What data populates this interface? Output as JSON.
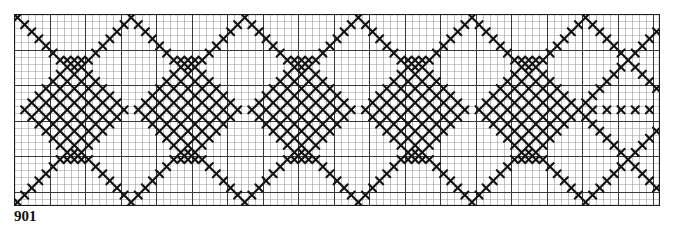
{
  "document": {
    "kind": "cross-stitch-pattern-chart",
    "label": "901",
    "background_color": "#ffffff"
  },
  "grid": {
    "origin_x": 14,
    "origin_y": 14,
    "cell_size": 7.1,
    "columns": 91,
    "rows": 27,
    "minor_line_color": "#9a9a9a",
    "minor_line_width": 0.6,
    "major_line_color": "#3a3a3a",
    "major_line_width": 1.0,
    "major_every": 5,
    "border_color": "#1a1a1a",
    "border_width": 1.2
  },
  "stitch": {
    "symbol": "x",
    "symbol_name": "cross-stitch-x",
    "color": "#111111",
    "stroke_width": 2.1
  },
  "chart_data": {
    "type": "heatmap",
    "title": "901",
    "xlabel": "",
    "ylabel": "",
    "grid": true,
    "legend": "none",
    "columns": 91,
    "rows": 27,
    "repeat_period_columns": 16,
    "symmetry": "mirror-horizontal-axis",
    "filled_cells_by_row": {
      "0": [
        0,
        16,
        32,
        48,
        64,
        80
      ],
      "1": [
        1,
        15,
        17,
        31,
        33,
        47,
        49,
        63,
        65,
        79,
        81
      ],
      "2": [
        2,
        14,
        18,
        30,
        34,
        46,
        50,
        62,
        66,
        78,
        82,
        90
      ],
      "3": [
        3,
        13,
        19,
        29,
        35,
        45,
        51,
        61,
        67,
        77,
        83,
        89
      ],
      "4": [
        4,
        12,
        20,
        28,
        36,
        44,
        52,
        60,
        68,
        76,
        84,
        88
      ],
      "5": [
        5,
        11,
        21,
        27,
        37,
        43,
        53,
        59,
        69,
        75,
        85,
        87
      ],
      "6": [
        6,
        7,
        8,
        9,
        10,
        22,
        23,
        24,
        25,
        26,
        38,
        39,
        40,
        41,
        42,
        54,
        55,
        56,
        57,
        58,
        70,
        71,
        72,
        73,
        74,
        86
      ],
      "7": [
        7,
        8,
        9,
        23,
        24,
        25,
        39,
        40,
        41,
        55,
        56,
        57,
        71,
        72,
        73,
        85,
        87
      ],
      "8": [
        6,
        8,
        10,
        22,
        24,
        26,
        38,
        40,
        42,
        54,
        56,
        58,
        70,
        72,
        74,
        84,
        88
      ],
      "9": [
        5,
        7,
        9,
        11,
        21,
        23,
        25,
        27,
        37,
        39,
        41,
        43,
        53,
        55,
        57,
        59,
        69,
        71,
        73,
        75,
        83,
        89
      ],
      "10": [
        4,
        6,
        8,
        10,
        12,
        20,
        22,
        24,
        26,
        28,
        36,
        38,
        40,
        42,
        44,
        52,
        54,
        56,
        58,
        60,
        68,
        70,
        72,
        74,
        76,
        82,
        90
      ],
      "11": [
        3,
        5,
        7,
        9,
        11,
        13,
        19,
        21,
        23,
        25,
        27,
        29,
        35,
        37,
        39,
        41,
        43,
        45,
        51,
        53,
        55,
        57,
        59,
        61,
        67,
        69,
        71,
        73,
        75,
        77,
        81
      ],
      "12": [
        2,
        4,
        6,
        8,
        10,
        12,
        14,
        18,
        20,
        22,
        24,
        26,
        28,
        30,
        34,
        36,
        38,
        40,
        42,
        44,
        46,
        50,
        52,
        54,
        56,
        58,
        60,
        62,
        66,
        68,
        70,
        72,
        74,
        76,
        78,
        80
      ],
      "13": [
        1,
        3,
        5,
        7,
        9,
        11,
        13,
        15,
        17,
        19,
        21,
        23,
        25,
        27,
        29,
        31,
        33,
        35,
        37,
        39,
        41,
        43,
        45,
        47,
        49,
        51,
        53,
        55,
        57,
        59,
        61,
        63,
        65,
        67,
        69,
        71,
        73,
        75,
        77,
        79,
        81,
        83,
        85,
        87,
        89
      ],
      "14": [
        2,
        4,
        6,
        8,
        10,
        12,
        14,
        18,
        20,
        22,
        24,
        26,
        28,
        30,
        34,
        36,
        38,
        40,
        42,
        44,
        46,
        50,
        52,
        54,
        56,
        58,
        60,
        62,
        66,
        68,
        70,
        72,
        74,
        76,
        78,
        80
      ],
      "15": [
        3,
        5,
        7,
        9,
        11,
        13,
        19,
        21,
        23,
        25,
        27,
        29,
        35,
        37,
        39,
        41,
        43,
        45,
        51,
        53,
        55,
        57,
        59,
        61,
        67,
        69,
        71,
        73,
        75,
        77,
        81
      ],
      "16": [
        4,
        6,
        8,
        10,
        12,
        20,
        22,
        24,
        26,
        28,
        36,
        38,
        40,
        42,
        44,
        52,
        54,
        56,
        58,
        60,
        68,
        70,
        72,
        74,
        76,
        82,
        90
      ],
      "17": [
        5,
        7,
        9,
        11,
        21,
        23,
        25,
        27,
        37,
        39,
        41,
        43,
        53,
        55,
        57,
        59,
        69,
        71,
        73,
        75,
        83,
        89
      ],
      "18": [
        6,
        8,
        10,
        22,
        24,
        26,
        38,
        40,
        42,
        54,
        56,
        58,
        70,
        72,
        74,
        84,
        88
      ],
      "19": [
        7,
        8,
        9,
        23,
        24,
        25,
        39,
        40,
        41,
        55,
        56,
        57,
        71,
        72,
        73,
        85,
        87
      ],
      "20": [
        6,
        7,
        8,
        9,
        10,
        22,
        23,
        24,
        25,
        26,
        38,
        39,
        40,
        41,
        42,
        54,
        55,
        56,
        57,
        58,
        70,
        71,
        72,
        73,
        74,
        86
      ],
      "21": [
        5,
        11,
        21,
        27,
        37,
        43,
        53,
        59,
        69,
        75,
        85,
        87
      ],
      "22": [
        4,
        12,
        20,
        28,
        36,
        44,
        52,
        60,
        68,
        76,
        84,
        88
      ],
      "23": [
        3,
        13,
        19,
        29,
        35,
        45,
        51,
        61,
        67,
        77,
        83,
        89
      ],
      "24": [
        2,
        14,
        18,
        30,
        34,
        46,
        50,
        62,
        66,
        78,
        82,
        90
      ],
      "25": [
        1,
        15,
        17,
        31,
        33,
        47,
        49,
        63,
        65,
        79,
        81
      ],
      "26": [
        0,
        16,
        32,
        48,
        64,
        80
      ]
    }
  }
}
